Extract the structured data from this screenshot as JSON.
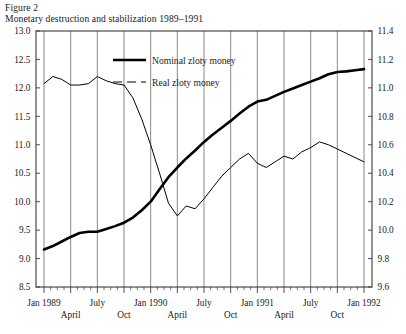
{
  "figure": {
    "label": "Figure 2",
    "title": "Monetary destruction and stabilization 1989–1991"
  },
  "chart_data": {
    "type": "line",
    "title": "Monetary destruction and stabilization 1989–1991",
    "subtitle": "Figure 2",
    "xlabel": "",
    "ylabel": "",
    "grid": true,
    "legend_position": "top-center",
    "axes": {
      "left": {
        "label": "",
        "ylim": [
          8.5,
          13.0
        ],
        "ticks": [
          "8.5",
          "9.0",
          "9.5",
          "10.0",
          "10.5",
          "11.0",
          "11.5",
          "12.0",
          "12.5",
          "13.0"
        ],
        "tick_values": [
          8.5,
          9.0,
          9.5,
          10.0,
          10.5,
          11.0,
          11.5,
          12.0,
          12.5,
          13.0
        ],
        "series": "Nominal zloty money"
      },
      "right": {
        "label": "",
        "ylim": [
          9.6,
          11.4
        ],
        "ticks": [
          "9.6",
          "9.8",
          "10.0",
          "10.2",
          "10.4",
          "10.6",
          "10.8",
          "11.0",
          "11.2",
          "11.4"
        ],
        "tick_values": [
          9.6,
          9.8,
          10.0,
          10.2,
          10.4,
          10.6,
          10.8,
          11.0,
          11.2,
          11.4
        ],
        "series": "Real zloty money"
      },
      "x": {
        "major_ticks": [
          "Jan 1989",
          "April",
          "July",
          "Oct",
          "Jan 1990",
          "April",
          "July",
          "Oct",
          "Jan 1991",
          "April",
          "July",
          "Oct",
          "Jan 1992"
        ],
        "major_tick_rows": [
          0,
          1,
          0,
          1,
          0,
          1,
          0,
          1,
          0,
          1,
          0,
          1,
          0
        ],
        "minor_ticks_per_major": 3,
        "range": [
          "Jan 1989",
          "Jan 1992"
        ]
      }
    },
    "legend": [
      {
        "name": "Nominal zloty money",
        "style": "solid",
        "width": 2.6,
        "color": "#000000",
        "axis": "left"
      },
      {
        "name": "Real zloty money",
        "style": "dashed",
        "width": 1.0,
        "color": "#000000",
        "axis": "right"
      }
    ],
    "x": [
      "Jan 1989",
      "Feb 1989",
      "Mar 1989",
      "Apr 1989",
      "May 1989",
      "Jun 1989",
      "Jul 1989",
      "Aug 1989",
      "Sep 1989",
      "Oct 1989",
      "Nov 1989",
      "Dec 1989",
      "Jan 1990",
      "Feb 1990",
      "Mar 1990",
      "Apr 1990",
      "May 1990",
      "Jun 1990",
      "Jul 1990",
      "Aug 1990",
      "Sep 1990",
      "Oct 1990",
      "Nov 1990",
      "Dec 1990",
      "Jan 1991",
      "Feb 1991",
      "Mar 1991",
      "Apr 1991",
      "May 1991",
      "Jun 1991",
      "Jul 1991",
      "Aug 1991",
      "Sep 1991",
      "Oct 1991",
      "Nov 1991",
      "Dec 1991",
      "Jan 1992"
    ],
    "series": [
      {
        "name": "Nominal zloty money",
        "axis": "left",
        "units": "log level",
        "values": [
          9.16,
          9.22,
          9.3,
          9.38,
          9.45,
          9.47,
          9.47,
          9.52,
          9.57,
          9.63,
          9.72,
          9.85,
          10.0,
          10.22,
          10.43,
          10.6,
          10.76,
          10.9,
          11.05,
          11.18,
          11.3,
          11.42,
          11.55,
          11.67,
          11.76,
          11.79,
          11.86,
          11.93,
          11.99,
          12.05,
          12.11,
          12.17,
          12.24,
          12.28,
          12.29,
          12.31,
          12.33
        ]
      },
      {
        "name": "Real zloty money",
        "axis": "right",
        "units": "log level",
        "values": [
          11.03,
          11.08,
          11.06,
          11.02,
          11.02,
          11.03,
          11.08,
          11.05,
          11.03,
          11.02,
          10.93,
          10.78,
          10.6,
          10.4,
          10.19,
          10.1,
          10.17,
          10.15,
          10.22,
          10.3,
          10.38,
          10.44,
          10.5,
          10.54,
          10.47,
          10.44,
          10.48,
          10.52,
          10.5,
          10.55,
          10.58,
          10.62,
          10.6,
          10.57,
          10.54,
          10.51,
          10.48
        ]
      }
    ]
  }
}
